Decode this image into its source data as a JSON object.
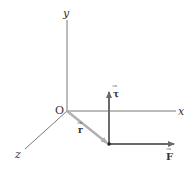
{
  "diagram": {
    "axes": {
      "x_label": "x",
      "y_label": "y",
      "z_label": "z",
      "origin_label": "O"
    },
    "vectors": {
      "position": {
        "label": "r",
        "arrow": "→",
        "color": "#b0b0b0"
      },
      "torque": {
        "label": "τ",
        "arrow": "→",
        "color": "#6a6a6a"
      },
      "force": {
        "label": "F",
        "arrow": "→",
        "color": "#6a6a6a"
      }
    },
    "colors": {
      "axis": "#555555",
      "background": "#ffffff"
    }
  }
}
